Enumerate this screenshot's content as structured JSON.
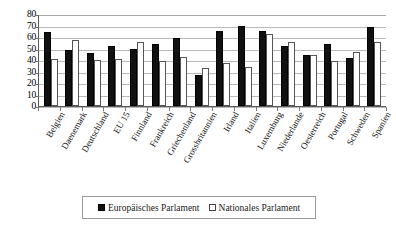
{
  "chart_data": {
    "type": "bar",
    "title": "",
    "xlabel": "",
    "ylabel": "",
    "ylim": [
      0,
      80
    ],
    "ytick_step": 10,
    "yticks": [
      "80",
      "70",
      "60",
      "50",
      "40",
      "30",
      "20",
      "10",
      "0"
    ],
    "grid": true,
    "legend_position": "bottom",
    "categories": [
      "Belgien",
      "Daenemark",
      "Deutschland",
      "EU 15",
      "Finnland",
      "Frankreich",
      "Griechenland",
      "Grossbritannien",
      "Irland",
      "Italien",
      "Luxemburg",
      "Niederlande",
      "Oesterreich",
      "Portugal",
      "Schweden",
      "Spanien"
    ],
    "series": [
      {
        "name": "Europäisches Parlament",
        "color": "#111111",
        "style": "filled",
        "values": [
          64,
          49,
          46,
          52,
          50,
          54,
          59,
          27,
          65,
          70,
          65,
          52,
          44,
          54,
          42,
          69
        ]
      },
      {
        "name": "Nationales Parlament",
        "color": "#ffffff",
        "style": "hollow",
        "values": [
          41,
          57,
          40,
          41,
          56,
          39,
          43,
          33,
          37,
          34,
          63,
          56,
          44,
          39,
          47,
          56
        ]
      }
    ]
  },
  "legend": {
    "items": [
      {
        "label": "Europäisches Parlament",
        "swatch": "filled-square-icon"
      },
      {
        "label": "Nationales Parlament",
        "swatch": "hollow-square-icon"
      }
    ]
  }
}
